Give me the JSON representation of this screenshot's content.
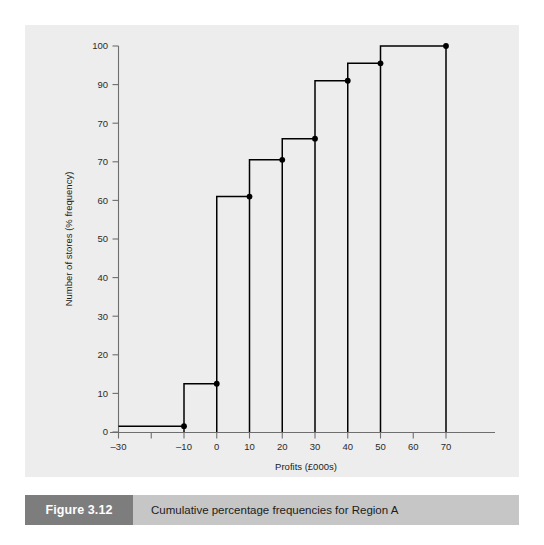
{
  "figure": {
    "number_label": "Figure 3.12",
    "caption": "Cumulative percentage frequencies for Region A"
  },
  "chart_data": {
    "type": "line",
    "subtype": "step-ogive",
    "title": "Cumulative percentage frequencies for Region A",
    "xlabel": "Profits (£000s)",
    "ylabel": "Number of stores (% frequency)",
    "xlim": [
      -30,
      77
    ],
    "ylim": [
      0,
      100
    ],
    "grid": false,
    "legend": null,
    "x_ticks": [
      -30,
      -20,
      -10,
      0,
      10,
      20,
      30,
      40,
      50,
      60,
      70
    ],
    "x_tick_labels": [
      "–30",
      "",
      "–10",
      "0",
      "10",
      "20",
      "30",
      "40",
      "50",
      "60",
      "70"
    ],
    "y_ticks": [
      0,
      10,
      20,
      30,
      40,
      50,
      60,
      70,
      80,
      90,
      100
    ],
    "y_tick_labels": [
      "0",
      "10",
      "20",
      "30",
      "40",
      "50",
      "60",
      "70",
      "70",
      "90",
      "100"
    ],
    "note": "The y-axis tick at the 80 position is printed as '70' in the original figure.",
    "x": [
      -30,
      -10,
      0,
      10,
      20,
      30,
      40,
      50,
      70
    ],
    "cumulative_percent": [
      1.5,
      1.5,
      12.5,
      61,
      70.5,
      76,
      91,
      95.5,
      100
    ],
    "steps": [
      {
        "from": -30,
        "to": -10,
        "value": 1.5
      },
      {
        "from": -10,
        "to": 0,
        "value": 12.5
      },
      {
        "from": 0,
        "to": 10,
        "value": 61
      },
      {
        "from": 10,
        "to": 20,
        "value": 70.5
      },
      {
        "from": 20,
        "to": 30,
        "value": 76
      },
      {
        "from": 30,
        "to": 40,
        "value": 91
      },
      {
        "from": 40,
        "to": 50,
        "value": 95.5
      },
      {
        "from": 50,
        "to": 70,
        "value": 100
      }
    ],
    "markers": [
      {
        "x": -10,
        "y": 1.5
      },
      {
        "x": 0,
        "y": 12.5
      },
      {
        "x": 10,
        "y": 61
      },
      {
        "x": 20,
        "y": 70.5
      },
      {
        "x": 30,
        "y": 76
      },
      {
        "x": 40,
        "y": 91
      },
      {
        "x": 50,
        "y": 95.5
      },
      {
        "x": 70,
        "y": 100
      }
    ],
    "colors": {
      "panel_background": "#ededed",
      "page_background": "#ffffff",
      "line": "#000000",
      "marker": "#000000",
      "axis": "#6e6e6e",
      "caption_bar": "#c6c6c6",
      "figure_number_box": "#7d7d7d",
      "figure_number_text": "#ffffff"
    }
  }
}
